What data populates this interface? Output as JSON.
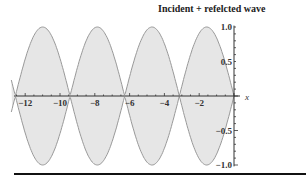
{
  "chart_data": {
    "type": "area",
    "title": "Incident + refelcted wave",
    "xlabel": "x",
    "ylabel": "",
    "xlim": [
      -12.8,
      0
    ],
    "ylim": [
      -1.0,
      1.0
    ],
    "x_ticks": [
      "-12",
      "-10",
      "-8",
      "-6",
      "-4",
      "-2"
    ],
    "y_ticks": [
      "1.0",
      "0.5",
      "-0.5",
      "-1.0"
    ],
    "series": [
      {
        "name": "envelope upper",
        "function": "|sin(x)|",
        "nodes": [
          -12.57,
          -9.42,
          -6.28,
          -3.14,
          0
        ],
        "amplitude": 1.0
      },
      {
        "name": "envelope lower",
        "function": "-|sin(x)|",
        "nodes": [
          -12.57,
          -9.42,
          -6.28,
          -3.14,
          0
        ],
        "amplitude": -1.0
      }
    ],
    "fill_color": "#e6e6e6",
    "line_color": "#999999",
    "grid": false
  }
}
